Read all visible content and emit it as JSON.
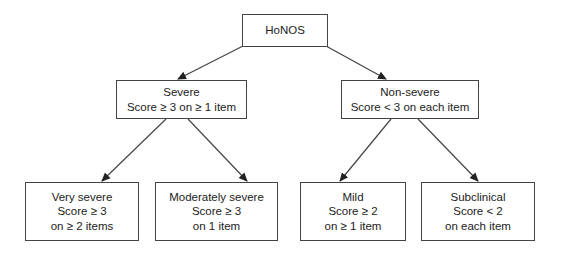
{
  "diagram": {
    "type": "tree",
    "root": {
      "id": "honos",
      "lines": [
        "HoNOS"
      ]
    },
    "level1": [
      {
        "id": "severe",
        "lines": [
          "Severe",
          "Score ≥ 3 on ≥ 1 item"
        ]
      },
      {
        "id": "non-severe",
        "lines": [
          "Non-severe",
          "Score < 3 on each item"
        ]
      }
    ],
    "level2": [
      {
        "id": "very-severe",
        "parent": "severe",
        "lines": [
          "Very severe",
          "Score ≥ 3",
          "on ≥ 2 items"
        ]
      },
      {
        "id": "moderately-severe",
        "parent": "severe",
        "lines": [
          "Moderately severe",
          "Score ≥ 3",
          "on 1 item"
        ]
      },
      {
        "id": "mild",
        "parent": "non-severe",
        "lines": [
          "Mild",
          "Score ≥ 2",
          "on ≥ 1 item"
        ]
      },
      {
        "id": "subclinical",
        "parent": "non-severe",
        "lines": [
          "Subclinical",
          "Score < 2",
          "on each item"
        ]
      }
    ],
    "edges": [
      [
        "honos",
        "severe"
      ],
      [
        "honos",
        "non-severe"
      ],
      [
        "severe",
        "very-severe"
      ],
      [
        "severe",
        "moderately-severe"
      ],
      [
        "non-severe",
        "mild"
      ],
      [
        "non-severe",
        "subclinical"
      ]
    ],
    "colors": {
      "line": "#444444",
      "arrow": "#222222",
      "background": "#ffffff"
    }
  }
}
